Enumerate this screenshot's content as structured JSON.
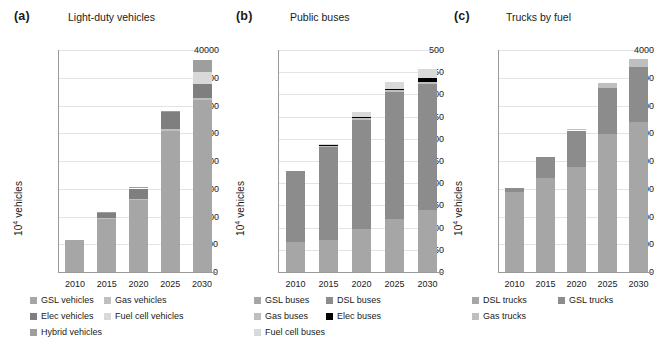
{
  "figure": {
    "panels": [
      {
        "letter": "(a)",
        "title": "Light-duty vehicles",
        "ylabel_prefix": "10",
        "ylabel_sup": "4",
        "ylabel_suffix": " vehicles"
      },
      {
        "letter": "(b)",
        "title": "Public buses",
        "ylabel_prefix": "10",
        "ylabel_sup": "4",
        "ylabel_suffix": " vehicles"
      },
      {
        "letter": "(c)",
        "title": "Trucks by fuel",
        "ylabel_prefix": "10",
        "ylabel_sup": "4",
        "ylabel_suffix": " vehicles"
      }
    ]
  },
  "colors": {
    "gsl": "#a6a6a6",
    "dsl": "#8c8c8c",
    "gas": "#bfbfbf",
    "elec_vehicles": "#7f7f7f",
    "elec_buses": "#000000",
    "fuelcell": "#d9d9d9",
    "hybrid": "#9e9e9e",
    "axis": "#9a9a9a",
    "grid": "#e3e3e3",
    "text": "#1a1a1a"
  },
  "chart_data": [
    {
      "type": "bar",
      "stacked": true,
      "panel": "a",
      "title": "Light-duty vehicles",
      "xlabel": "",
      "ylabel": "10^4 vehicles",
      "categories": [
        "2010",
        "2015",
        "2020",
        "2025",
        "2030"
      ],
      "yticks": [
        0,
        5000,
        10000,
        15000,
        20000,
        25000,
        30000,
        35000,
        40000
      ],
      "ylim": [
        0,
        40000
      ],
      "grid": true,
      "legend_position": "below",
      "series": [
        {
          "name": "GSL vehicles",
          "color": "#a6a6a6",
          "values": [
            5800,
            9500,
            12900,
            25400,
            31000
          ]
        },
        {
          "name": "Gas vehicles",
          "color": "#bfbfbf",
          "values": [
            0,
            200,
            250,
            300,
            350
          ]
        },
        {
          "name": "Elec vehicles",
          "color": "#7f7f7f",
          "values": [
            0,
            1000,
            1900,
            3100,
            2600
          ]
        },
        {
          "name": "Fuel cell vehicles",
          "color": "#d9d9d9",
          "values": [
            0,
            0,
            0,
            0,
            2100
          ]
        },
        {
          "name": "Hybrid vehicles",
          "color": "#9e9e9e",
          "values": [
            0,
            200,
            300,
            300,
            2200
          ]
        }
      ],
      "totals": [
        5800,
        10900,
        15350,
        29100,
        38250
      ]
    },
    {
      "type": "bar",
      "stacked": true,
      "panel": "b",
      "title": "Public buses",
      "xlabel": "",
      "ylabel": "10^4 vehicles",
      "categories": [
        "2010",
        "2015",
        "2020",
        "2025",
        "2030"
      ],
      "yticks": [
        0,
        50,
        100,
        150,
        200,
        250,
        300,
        350,
        400,
        450,
        500
      ],
      "ylim": [
        0,
        500
      ],
      "grid": true,
      "legend_position": "below",
      "series": [
        {
          "name": "GSL buses",
          "color": "#a6a6a6",
          "values": [
            68,
            73,
            97,
            120,
            140
          ]
        },
        {
          "name": "DSL buses",
          "color": "#8c8c8c",
          "values": [
            160,
            208,
            246,
            285,
            283
          ]
        },
        {
          "name": "Gas buses",
          "color": "#bfbfbf",
          "values": [
            0,
            2,
            3,
            4,
            5
          ]
        },
        {
          "name": "Elec buses",
          "color": "#000000",
          "values": [
            0,
            3,
            4,
            4,
            8
          ]
        },
        {
          "name": "Fuel cell buses",
          "color": "#d9d9d9",
          "values": [
            0,
            2,
            10,
            14,
            22
          ]
        }
      ],
      "totals": [
        228,
        288,
        360,
        427,
        458
      ]
    },
    {
      "type": "bar",
      "stacked": true,
      "panel": "c",
      "title": "Trucks by fuel",
      "xlabel": "",
      "ylabel": "10^4 vehicles",
      "categories": [
        "2010",
        "2015",
        "2020",
        "2025",
        "2030"
      ],
      "yticks": [
        0,
        500,
        1000,
        1500,
        2000,
        2500,
        3000,
        3500,
        4000
      ],
      "ylim": [
        0,
        4000
      ],
      "grid": true,
      "legend_position": "below",
      "series": [
        {
          "name": "DSL trucks",
          "color": "#a6a6a6",
          "values": [
            1450,
            1700,
            1900,
            2480,
            2700
          ]
        },
        {
          "name": "GSL trucks",
          "color": "#8c8c8c",
          "values": [
            60,
            380,
            650,
            840,
            1000
          ]
        },
        {
          "name": "Gas trucks",
          "color": "#bfbfbf",
          "values": [
            0,
            0,
            30,
            90,
            130
          ]
        }
      ],
      "totals": [
        1510,
        2080,
        2580,
        3410,
        3830
      ]
    }
  ],
  "legends": [
    {
      "panel": "a",
      "rows": [
        [
          {
            "label": "GSL vehicles",
            "color": "#a6a6a6"
          },
          {
            "label": "Gas vehicles",
            "color": "#bfbfbf"
          }
        ],
        [
          {
            "label": "Elec vehicles",
            "color": "#7f7f7f"
          },
          {
            "label": "Fuel cell vehicles",
            "color": "#d9d9d9"
          }
        ],
        [
          {
            "label": "Hybrid vehicles",
            "color": "#9e9e9e"
          }
        ]
      ]
    },
    {
      "panel": "b",
      "rows": [
        [
          {
            "label": "GSL buses",
            "color": "#a6a6a6"
          },
          {
            "label": "DSL buses",
            "color": "#8c8c8c"
          }
        ],
        [
          {
            "label": "Gas buses",
            "color": "#bfbfbf"
          },
          {
            "label": "Elec buses",
            "color": "#000000"
          }
        ],
        [
          {
            "label": "Fuel cell buses",
            "color": "#d9d9d9"
          }
        ]
      ]
    },
    {
      "panel": "c",
      "rows": [
        [
          {
            "label": "DSL trucks",
            "color": "#a6a6a6"
          },
          {
            "label": "GSL trucks",
            "color": "#8c8c8c"
          }
        ],
        [
          {
            "label": "Gas trucks",
            "color": "#bfbfbf"
          }
        ]
      ]
    }
  ]
}
